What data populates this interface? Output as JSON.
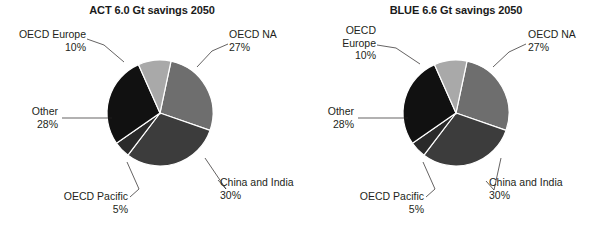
{
  "figure": {
    "background_color": "#ffffff",
    "text_color": "#231f20"
  },
  "chart_data": [
    {
      "type": "pie",
      "title": "ACT 6.0 Gt savings 2050",
      "scenario": "ACT",
      "total_savings": "6.0 Gt",
      "year": "2050",
      "unit": "%",
      "start_angle_deg": 12,
      "direction": "clockwise",
      "categories": [
        "OECD NA",
        "China and India",
        "OECD Pacific",
        "Other",
        "OECD Europe"
      ],
      "values": [
        27,
        30,
        5,
        28,
        10
      ],
      "labels": [
        "27%",
        "30%",
        "5%",
        "28%",
        "10%"
      ],
      "colors": [
        "#6e6e6e",
        "#3c3c3c",
        "#2a2a2a",
        "#111111",
        "#a9a9a9"
      ],
      "slice_border_color": "#ffffff",
      "legend": "none",
      "grid": false,
      "annotations": [
        {
          "name": "OECD Europe",
          "value": "10%"
        },
        {
          "name": "OECD NA",
          "value": "27%"
        },
        {
          "name": "Other",
          "value": "28%"
        },
        {
          "name": "OECD Pacific",
          "value": "5%"
        },
        {
          "name": "China and India",
          "value": "30%"
        }
      ]
    },
    {
      "type": "pie",
      "title": "BLUE 6.6 Gt savings 2050",
      "scenario": "BLUE",
      "total_savings": "6.6 Gt",
      "year": "2050",
      "unit": "%",
      "start_angle_deg": 12,
      "direction": "clockwise",
      "categories": [
        "OECD NA",
        "China and India",
        "OECD Pacific",
        "Other",
        "OECD Europe"
      ],
      "values": [
        27,
        30,
        5,
        28,
        10
      ],
      "labels": [
        "27%",
        "30%",
        "5%",
        "28%",
        "10%"
      ],
      "colors": [
        "#6e6e6e",
        "#3c3c3c",
        "#2a2a2a",
        "#111111",
        "#a9a9a9"
      ],
      "slice_border_color": "#ffffff",
      "legend": "none",
      "grid": false,
      "annotations": [
        {
          "name": "OECD Europe",
          "value": "10%"
        },
        {
          "name": "OECD NA",
          "value": "27%"
        },
        {
          "name": "Other",
          "value": "28%"
        },
        {
          "name": "OECD Pacific",
          "value": "5%"
        },
        {
          "name": "China and India",
          "value": "30%"
        }
      ]
    }
  ],
  "left_chart": {
    "title": "ACT 6.0 Gt savings 2050",
    "labels": {
      "oecd_europe_name": "OECD Europe",
      "oecd_europe_pct": "10%",
      "oecd_na_name": "OECD NA",
      "oecd_na_pct": "27%",
      "other_name": "Other",
      "other_pct": "28%",
      "oecd_pacific_name": "OECD Pacific",
      "oecd_pacific_pct": "5%",
      "china_india_name": "China and India",
      "china_india_pct": "30%"
    }
  },
  "right_chart": {
    "title": "BLUE 6.6 Gt savings 2050",
    "labels": {
      "oecd_europe_name_line1": "OECD",
      "oecd_europe_name_line2": "Europe",
      "oecd_europe_pct": "10%",
      "oecd_na_name": "OECD NA",
      "oecd_na_pct": "27%",
      "other_name": "Other",
      "other_pct": "28%",
      "oecd_pacific_name": "OECD Pacific",
      "oecd_pacific_pct": "5%",
      "china_india_name": "China and India",
      "china_india_pct": "30%"
    }
  }
}
